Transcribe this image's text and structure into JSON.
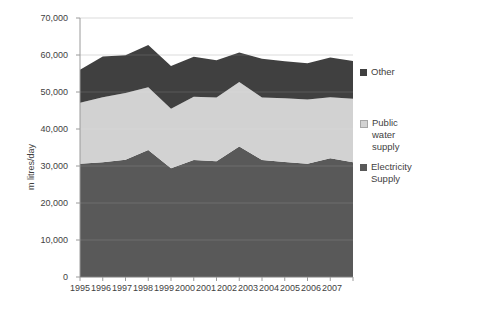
{
  "chart_data": {
    "type": "area",
    "stacked": true,
    "title": "",
    "xlabel": "",
    "ylabel": "m litres/day",
    "categories": [
      "1995",
      "1996",
      "1997",
      "1998",
      "1999",
      "2000",
      "2001",
      "2002",
      "2003",
      "2004",
      "2005",
      "2006",
      "2007"
    ],
    "ylim": [
      0,
      70000
    ],
    "ytick_values": [
      0,
      10000,
      20000,
      30000,
      40000,
      50000,
      60000,
      70000
    ],
    "ytick_labels": [
      "0",
      "10,000",
      "20,000",
      "30,000",
      "40,000",
      "50,000",
      "60,000",
      "70,000"
    ],
    "grid": true,
    "legend_position": "right",
    "series": [
      {
        "name": "Electricity Supply",
        "color": "#595959",
        "values": [
          30600,
          31000,
          31700,
          34300,
          29400,
          31600,
          31300,
          35300,
          31600,
          31100,
          30600,
          32100,
          31000
        ]
      },
      {
        "name": "Public water supply",
        "color": "#d2d2d2",
        "values": [
          16500,
          17600,
          18000,
          17000,
          16100,
          17100,
          17200,
          17400,
          16900,
          17200,
          17400,
          16500,
          17200
        ]
      },
      {
        "name": "Other",
        "color": "#404040",
        "values": [
          8900,
          11000,
          10200,
          11400,
          11500,
          10800,
          10100,
          8000,
          10500,
          10000,
          9800,
          10700,
          10200
        ]
      }
    ],
    "series_totals": [
      56000,
      59600,
      59900,
      62700,
      57000,
      59500,
      58600,
      60700,
      59000,
      58300,
      57800,
      59300,
      58400
    ]
  },
  "legend": {
    "entries": [
      {
        "label": "Other"
      },
      {
        "label": "Public water supply"
      },
      {
        "label": "Electricity Supply"
      }
    ]
  },
  "legend_lines": {
    "other": "Other",
    "public_1": "Public",
    "public_2": "water",
    "public_3": "supply",
    "electricity_1": "Electricity",
    "electricity_2": "Supply"
  }
}
